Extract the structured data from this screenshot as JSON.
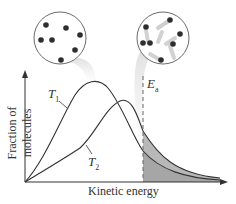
{
  "diagram": {
    "type": "Maxwell-Boltzmann distribution",
    "x_axis_label": "Kinetic energy",
    "y_axis_label": "Fraction of molecules",
    "curves": [
      {
        "label": "T",
        "subscript": "1",
        "description": "lower temperature, taller narrower peak"
      },
      {
        "label": "T",
        "subscript": "2",
        "description": "higher temperature, broader lower peak"
      }
    ],
    "threshold": {
      "label": "E",
      "subscript": "a"
    },
    "insets": [
      {
        "name": "slow-molecules",
        "molecule_count": 7
      },
      {
        "name": "fast-molecules",
        "molecule_count": 7
      }
    ],
    "colors": {
      "curve": "#333333",
      "shade": "#b5b5b5",
      "shade_light": "#d4d4d4",
      "background": "#ffffff"
    }
  }
}
